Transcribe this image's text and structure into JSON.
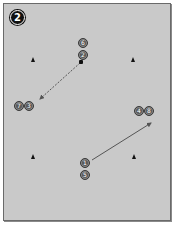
{
  "diagram": {
    "step_badge": "2",
    "colors": {
      "field": "#c9c9c9",
      "border": "#6a6a6a",
      "player": "#5b5b5b",
      "cone": "#111111",
      "arrow": "#555555",
      "badge": "#111111"
    },
    "players": [
      {
        "number": "6",
        "x": 78,
        "y": 38
      },
      {
        "number": "2",
        "x": 78,
        "y": 50
      },
      {
        "number": "7",
        "x": 14,
        "y": 101
      },
      {
        "number": "3",
        "x": 24,
        "y": 101
      },
      {
        "number": "4",
        "x": 134,
        "y": 106
      },
      {
        "number": "8",
        "x": 144,
        "y": 106
      },
      {
        "number": "1",
        "x": 80,
        "y": 158
      },
      {
        "number": "5",
        "x": 80,
        "y": 170
      }
    ],
    "cones": [
      {
        "x": 31,
        "y": 57
      },
      {
        "x": 131,
        "y": 57
      },
      {
        "x": 31,
        "y": 154
      },
      {
        "x": 132,
        "y": 154
      }
    ],
    "ball": {
      "x": 79,
      "y": 60
    },
    "arrows": [
      {
        "type": "dashed",
        "label": "pass",
        "x1": 80,
        "y1": 63,
        "x2": 40,
        "y2": 99
      },
      {
        "type": "solid",
        "label": "run",
        "x1": 92,
        "y1": 160,
        "x2": 151,
        "y2": 123
      }
    ]
  }
}
